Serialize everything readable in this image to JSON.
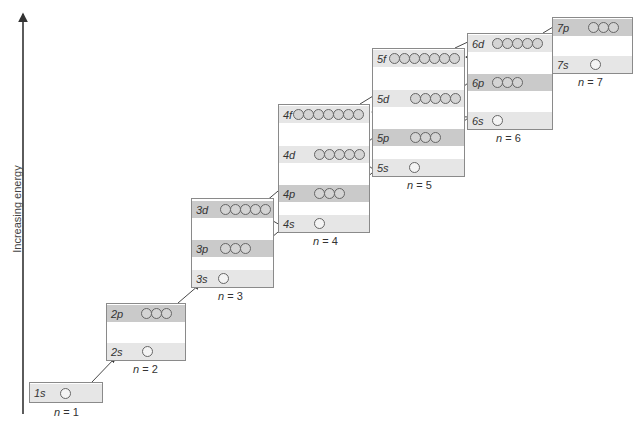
{
  "axis": {
    "label": "Increasing energy"
  },
  "shells": [
    {
      "n": "n = 1",
      "n_var": "n",
      "n_val": " = 1",
      "subshells": [
        {
          "label": "1s",
          "orbitals": 1,
          "tone": "light"
        }
      ]
    },
    {
      "n": "n = 2",
      "n_var": "n",
      "n_val": " = 2",
      "subshells": [
        {
          "label": "2p",
          "orbitals": 3,
          "tone": "dark"
        },
        {
          "label": "2s",
          "orbitals": 1,
          "tone": "light"
        }
      ]
    },
    {
      "n": "n = 3",
      "n_var": "n",
      "n_val": " = 3",
      "subshells": [
        {
          "label": "3d",
          "orbitals": 5,
          "tone": "dark"
        },
        {
          "label": "3p",
          "orbitals": 3,
          "tone": "dark"
        },
        {
          "label": "3s",
          "orbitals": 1,
          "tone": "light"
        }
      ]
    },
    {
      "n": "n = 4",
      "n_var": "n",
      "n_val": " = 4",
      "subshells": [
        {
          "label": "4f",
          "orbitals": 7,
          "tone": "light"
        },
        {
          "label": "4d",
          "orbitals": 5,
          "tone": "light"
        },
        {
          "label": "4p",
          "orbitals": 3,
          "tone": "dark"
        },
        {
          "label": "4s",
          "orbitals": 1,
          "tone": "light"
        }
      ]
    },
    {
      "n": "n = 5",
      "n_var": "n",
      "n_val": " = 5",
      "subshells": [
        {
          "label": "5f",
          "orbitals": 7,
          "tone": "light"
        },
        {
          "label": "5d",
          "orbitals": 5,
          "tone": "light"
        },
        {
          "label": "5p",
          "orbitals": 3,
          "tone": "dark"
        },
        {
          "label": "5s",
          "orbitals": 1,
          "tone": "light"
        }
      ]
    },
    {
      "n": "n = 6",
      "n_var": "n",
      "n_val": " = 6",
      "subshells": [
        {
          "label": "6d",
          "orbitals": 5,
          "tone": "light"
        },
        {
          "label": "6p",
          "orbitals": 3,
          "tone": "dark"
        },
        {
          "label": "6s",
          "orbitals": 1,
          "tone": "light"
        }
      ]
    },
    {
      "n": "n = 7",
      "n_var": "n",
      "n_val": " = 7",
      "subshells": [
        {
          "label": "7p",
          "orbitals": 3,
          "tone": "dark"
        },
        {
          "label": "7s",
          "orbitals": 1,
          "tone": "light"
        }
      ]
    }
  ],
  "filling_order": [
    "1s",
    "2s",
    "2p",
    "3s",
    "3p",
    "4s",
    "3d",
    "4p",
    "5s",
    "4d",
    "5p",
    "6s",
    "4f",
    "5d",
    "6p",
    "7s",
    "5f",
    "6d",
    "7p"
  ],
  "colors": {
    "band_dark": "#cacaca",
    "band_light": "#e6e6e6",
    "border": "#8a8a8a",
    "arrow": "#333333"
  }
}
